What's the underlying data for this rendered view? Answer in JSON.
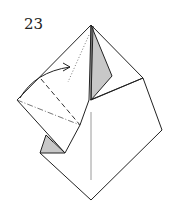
{
  "diagram": {
    "type": "origami-step",
    "step_number": "23",
    "colors": {
      "line": "#222222",
      "shade": "#c8c8c8",
      "valley_fold": "#333333",
      "mountain_fold": "#555555",
      "crease": "#9a9a9a"
    },
    "elements": [
      {
        "name": "model-outline",
        "kind": "paper outline"
      },
      {
        "name": "back-flap-shaded",
        "kind": "shaded reverse side flap"
      },
      {
        "name": "small-shaded-flap",
        "kind": "shaded reverse side triangle"
      },
      {
        "name": "valley-fold-line",
        "kind": "valley fold (dashed)"
      },
      {
        "name": "mountain-fold-line",
        "kind": "mountain fold (dash-dot)"
      },
      {
        "name": "crease-line",
        "kind": "existing crease (gray)"
      },
      {
        "name": "fold-arrow",
        "kind": "curved arrow indicating fold direction"
      }
    ]
  }
}
